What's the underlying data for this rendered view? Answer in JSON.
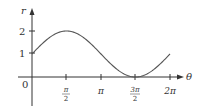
{
  "chart_data": {
    "type": "line",
    "title": "",
    "function": "r = 1 + sin θ",
    "xlabel": "θ",
    "ylabel": "r",
    "xlim": [
      0,
      6.5
    ],
    "ylim": [
      -0.8,
      2.3
    ],
    "grid": false,
    "legend": null,
    "x_ticks": [
      {
        "value": 1.5708,
        "label_num": "π",
        "label_den": "2"
      },
      {
        "value": 3.1416,
        "label": "π"
      },
      {
        "value": 4.7124,
        "label_num": "3π",
        "label_den": "2"
      },
      {
        "value": 6.2832,
        "label": "2π"
      }
    ],
    "y_ticks": [
      {
        "value": 1,
        "label": "1"
      },
      {
        "value": 2,
        "label": "2"
      }
    ],
    "origin_label": "0",
    "series": [
      {
        "name": "r = 1 + sin θ",
        "x": [
          0,
          0.7854,
          1.5708,
          2.3562,
          3.1416,
          3.927,
          4.7124,
          5.4978,
          6.2832
        ],
        "y": [
          1,
          1.707,
          2,
          1.707,
          1,
          0.293,
          0,
          0.293,
          1
        ]
      }
    ],
    "colors": {
      "curve": "#555555",
      "axis": "#333333"
    }
  },
  "labels": {
    "r_axis": "r",
    "theta_axis": "θ",
    "origin": "0",
    "y1": "1",
    "y2": "2",
    "pi_half_num": "π",
    "pi_half_den": "2",
    "pi": "π",
    "three_pi_half_num": "3π",
    "three_pi_half_den": "2",
    "two_pi": "2π"
  }
}
